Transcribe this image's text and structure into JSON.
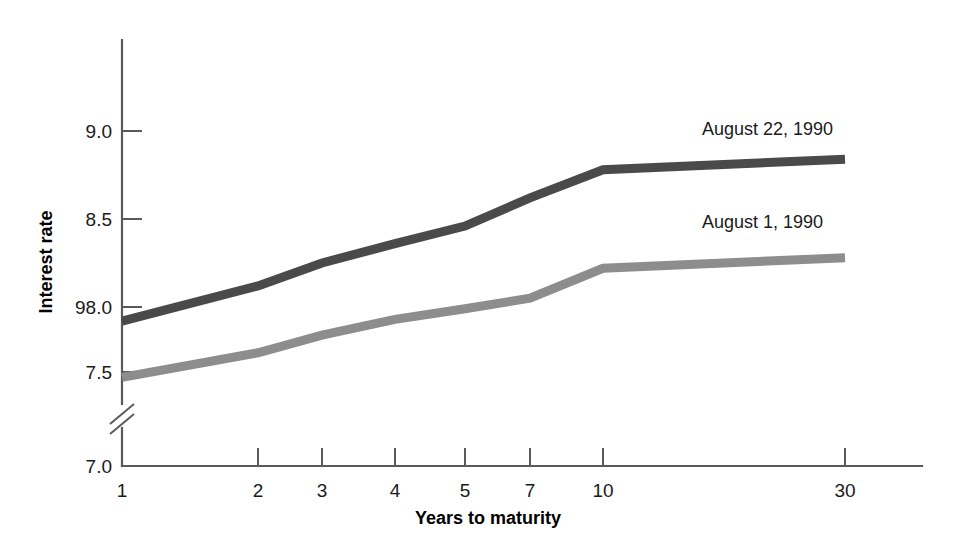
{
  "chart_data": {
    "type": "line",
    "title": "",
    "xlabel": "Years to maturity",
    "ylabel": "Interest rate",
    "x_tick_labels": [
      "1",
      "2",
      "3",
      "4",
      "5",
      "7",
      "10",
      "30"
    ],
    "x_values": [
      1,
      2,
      3,
      4,
      5,
      7,
      10,
      30
    ],
    "y_tick_labels": [
      "9.0",
      "8.5",
      "98.0",
      "7.5",
      "7.0"
    ],
    "y_tick_values": [
      9.0,
      8.0,
      8.0,
      7.5,
      7.0
    ],
    "ylim": [
      7.0,
      9.25
    ],
    "grid": false,
    "axis_break": true,
    "axis_break_note": "y-axis broken between 7.0 and 7.5",
    "legend_position": "inline-right",
    "series": [
      {
        "name": "August 22, 1990",
        "color": "#4a4a4a",
        "values": [
          7.92,
          8.12,
          8.25,
          8.36,
          8.46,
          8.62,
          8.78,
          8.84
        ]
      },
      {
        "name": "August 1, 1990",
        "color": "#8d8d8d",
        "values": [
          7.6,
          7.74,
          7.84,
          7.93,
          7.99,
          8.05,
          8.22,
          8.28
        ]
      }
    ]
  },
  "labels": {
    "series_1_label": "August 22, 1990",
    "series_2_label": "August 1, 1990",
    "x_axis_title": "Years to maturity",
    "y_axis_title": "Interest rate",
    "y0": "9.0",
    "y1": "8.5",
    "y2": "98.0",
    "y3": "7.5",
    "y4": "7.0",
    "x0": "1",
    "x1": "2",
    "x2": "3",
    "x3": "4",
    "x4": "5",
    "x5": "7",
    "x6": "10",
    "x7": "30"
  },
  "colors": {
    "series_1": "#4a4a4a",
    "series_2": "#8d8d8d",
    "axis": "#5a5a5a",
    "text": "#1a1a1a",
    "background": "#ffffff"
  }
}
